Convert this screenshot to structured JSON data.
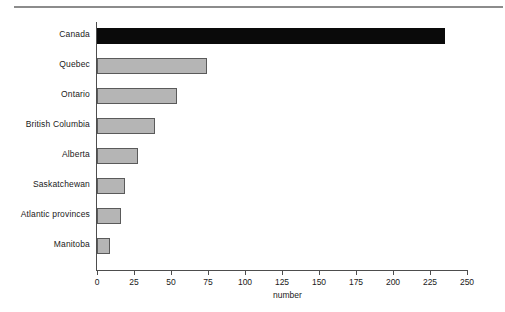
{
  "chart_data": {
    "type": "bar",
    "orientation": "horizontal",
    "title": "",
    "xlabel": "number",
    "ylabel": "",
    "xlim": [
      0,
      250
    ],
    "xticks": [
      0,
      25,
      50,
      75,
      100,
      125,
      150,
      175,
      200,
      225,
      250
    ],
    "xtick_labels": [
      "0",
      "25",
      "50",
      "75",
      "100",
      "125",
      "150",
      "175",
      "200",
      "225",
      "250"
    ],
    "grid": false,
    "legend": null,
    "categories": [
      "Canada",
      "Quebec",
      "Ontario",
      "British Columbia",
      "Alberta",
      "Saskatchewan",
      "Atlantic provinces",
      "Manitoba"
    ],
    "values": [
      235,
      74,
      54,
      39,
      28,
      19,
      16,
      9
    ],
    "bar_colors": [
      "#0a0a0a",
      "#b5b5b5",
      "#b5b5b5",
      "#b5b5b5",
      "#b5b5b5",
      "#b5b5b5",
      "#b5b5b5",
      "#b5b5b5"
    ],
    "highlight_category": "Canada",
    "bar_edge_color": "#5a5a5a",
    "axis_color": "#4d4d4d",
    "rule_color": "#8c8c8c",
    "background_color": "#ffffff"
  }
}
